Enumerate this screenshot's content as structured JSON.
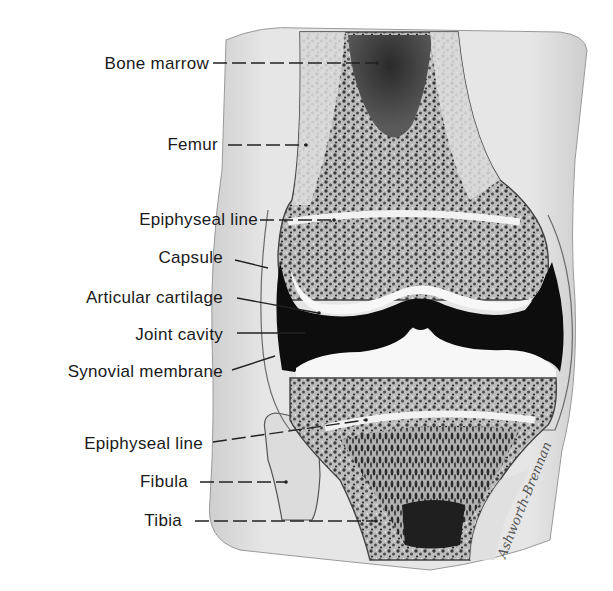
{
  "figure": {
    "labels": [
      {
        "id": "bone-marrow",
        "text": "Bone marrow"
      },
      {
        "id": "femur",
        "text": "Femur"
      },
      {
        "id": "epiphyseal-line-upper",
        "text": "Epiphyseal line"
      },
      {
        "id": "capsule",
        "text": "Capsule"
      },
      {
        "id": "articular-cartilage",
        "text": "Articular cartilage"
      },
      {
        "id": "joint-cavity",
        "text": "Joint cavity"
      },
      {
        "id": "synovial-membrane",
        "text": "Synovial membrane"
      },
      {
        "id": "epiphyseal-line-lower",
        "text": "Epiphyseal line"
      },
      {
        "id": "fibula",
        "text": "Fibula"
      },
      {
        "id": "tibia",
        "text": "Tibia"
      }
    ],
    "signature": "Ashworth-Brennan",
    "colors": {
      "background": "#ffffff",
      "tissue": "#d9d9d9",
      "bone": "#8a8a8a",
      "cavity": "#0d0d0d",
      "cartilage": "#f7f7f7",
      "text": "#1a1a1a"
    }
  }
}
